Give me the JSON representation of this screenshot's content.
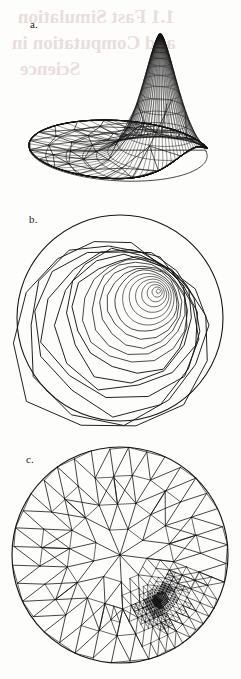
{
  "figure": {
    "background_color": "#fdfdfc",
    "ink_color": "#1a1a1a",
    "bleed_color": "#e9dedd",
    "width": 241,
    "height": 679
  },
  "panels": [
    {
      "id": "a",
      "label": "a.",
      "caption_role": "3D wireframe surface plot of the adaptive finite element solution",
      "kind": "surface-wireframe",
      "description": "Triangulated surface over a circular disk with a tall sharp peak at the right; mesh is extremely dense (nearly solid black) near the peak and coarse near the flat base."
    },
    {
      "id": "b",
      "label": "b.",
      "caption_role": "Contour plot of the same solution",
      "kind": "contour",
      "description": "Nested closed polygonal contour lines inside a circular domain, concentrated around an off-centre maximum in the upper right."
    },
    {
      "id": "c",
      "label": "c.",
      "caption_role": "Adaptively refined triangular mesh",
      "kind": "triangular-mesh",
      "description": "Delaunay-type triangulation of a disk with strong local refinement in the upper-right quadrant where triangles become so small the region appears solid black."
    }
  ],
  "chart_data": [
    {
      "type": "surface",
      "panel": "a",
      "title": "",
      "xlabel": "",
      "ylabel": "",
      "zlabel": "",
      "domain": "unit disk",
      "peak": {
        "x": 0.42,
        "y": 0.38,
        "z": 1.0
      },
      "baseline_z": 0.0,
      "zlim": [
        0,
        1
      ],
      "mesh_density": "graded: very fine at peak, coarse at boundary",
      "grid": false,
      "legend": "none"
    },
    {
      "type": "contour",
      "panel": "b",
      "title": "",
      "xlabel": "",
      "ylabel": "",
      "domain": "unit disk",
      "center": {
        "x": 0.4,
        "y": -0.28
      },
      "levels": [
        0.05,
        0.1,
        0.15,
        0.2,
        0.25,
        0.3,
        0.35,
        0.4,
        0.45,
        0.5,
        0.55,
        0.6,
        0.65,
        0.7,
        0.75,
        0.8,
        0.85,
        0.9,
        0.95
      ],
      "n_contours": 19,
      "grid": false,
      "legend": "none",
      "note": "contours are piecewise-linear polygons following the mesh edges"
    },
    {
      "type": "mesh",
      "panel": "c",
      "title": "",
      "xlabel": "",
      "ylabel": "",
      "domain": "unit disk",
      "refinement_center": {
        "x": 0.38,
        "y": 0.42
      },
      "coarse_triangle_count": 60,
      "refined_region": "upper-right quadrant",
      "max_refinement_levels": 9,
      "grid": false,
      "legend": "none"
    }
  ],
  "bleed_through": {
    "visible": true,
    "lines": [
      "1.1 Fast Simulation",
      "and Computation in",
      "Science"
    ],
    "note": "faint mirrored show-through of heading text from the reverse of the page"
  }
}
